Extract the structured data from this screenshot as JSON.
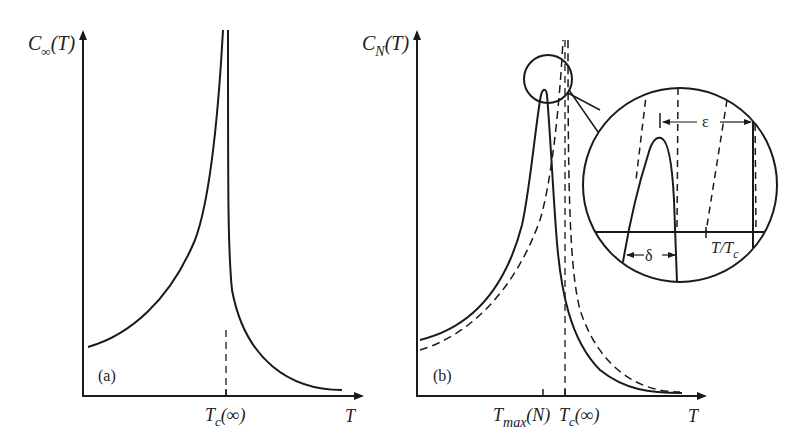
{
  "figure": {
    "panel_a": {
      "tag": "(a)",
      "y_label_main": "C",
      "y_label_sub": "∞",
      "y_label_arg": "(T)",
      "x_label": "T",
      "tick_label_main": "T",
      "tick_label_sub": "c",
      "tick_label_arg": "(∞)"
    },
    "panel_b": {
      "tag": "(b)",
      "y_label_main": "C",
      "y_label_sub": "N",
      "y_label_arg": "(T)",
      "x_label": "T",
      "tick1_label_main": "T",
      "tick1_label_sub": "max",
      "tick1_label_arg": "(N)",
      "tick2_label_main": "T",
      "tick2_label_sub": "c",
      "tick2_label_arg": "(∞)"
    },
    "inset": {
      "epsilon": "ε",
      "delta": "δ",
      "axis_label_main": "T/T",
      "axis_label_sub": "c"
    },
    "colors": {
      "ink": "#1a1a1a",
      "background": "#ffffff"
    }
  }
}
